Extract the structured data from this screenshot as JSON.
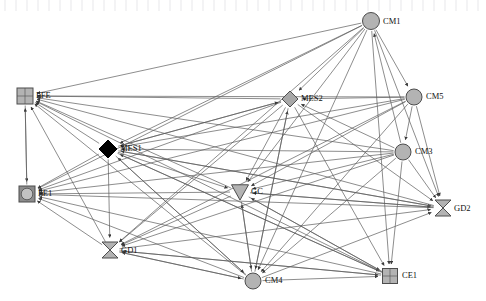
{
  "figure": {
    "kind": "directed-network-diagram",
    "width": 486,
    "height": 301,
    "background": "#ffffff",
    "edge_color": "#5b5b5b",
    "label_color": "#111111"
  },
  "chart_data": {
    "type": "diagram",
    "title": "",
    "xlabel": "",
    "ylabel": "",
    "directed": true,
    "nodes": [
      {
        "id": "CM1",
        "label": "CM1",
        "shape": "circle",
        "x": 371,
        "y": 21,
        "size": 17,
        "fill": "#b3b3b3",
        "stroke": "#4d4d4d",
        "label_dx": 12,
        "label_dy": 3
      },
      {
        "id": "FFE",
        "label": "FFE",
        "shape": "square",
        "x": 25,
        "y": 96,
        "size": 16,
        "fill": "#b3b3b3",
        "stroke": "#4d4d4d",
        "label_dx": 11,
        "label_dy": 2
      },
      {
        "id": "MES2",
        "label": "MES2",
        "shape": "diamond",
        "x": 290,
        "y": 99,
        "size": 16,
        "fill": "#a8a8a8",
        "stroke": "#4d4d4d",
        "label_dx": 11,
        "label_dy": 2
      },
      {
        "id": "CM5",
        "label": "CM5",
        "shape": "circle",
        "x": 414,
        "y": 97,
        "size": 16,
        "fill": "#b3b3b3",
        "stroke": "#4d4d4d",
        "label_dx": 12,
        "label_dy": 2
      },
      {
        "id": "MES1",
        "label": "MES1",
        "shape": "diamond",
        "x": 108,
        "y": 149,
        "size": 18,
        "fill": "#000000",
        "stroke": "#000000",
        "label_dx": 12,
        "label_dy": 2
      },
      {
        "id": "CM3",
        "label": "CM3",
        "shape": "circle",
        "x": 403,
        "y": 152,
        "size": 16,
        "fill": "#b3b3b3",
        "stroke": "#4d4d4d",
        "label_dx": 12,
        "label_dy": 2
      },
      {
        "id": "FE1",
        "label": "FE1",
        "shape": "circle-in-square",
        "x": 27,
        "y": 194,
        "size": 16,
        "fill": "#b3b3b3",
        "stroke": "#4d4d4d",
        "label_dx": 11,
        "label_dy": 2
      },
      {
        "id": "GC",
        "label": "GC",
        "shape": "triangle-down",
        "x": 240,
        "y": 192,
        "size": 17,
        "fill": "#b3b3b3",
        "stroke": "#4d4d4d",
        "label_dx": 11,
        "label_dy": 2
      },
      {
        "id": "GD2",
        "label": "GD2",
        "shape": "bowtie",
        "x": 443,
        "y": 208,
        "size": 16,
        "fill": "#b3b3b3",
        "stroke": "#4d4d4d",
        "label_dx": 11,
        "label_dy": 3
      },
      {
        "id": "GD1",
        "label": "GD1",
        "shape": "bowtie",
        "x": 110,
        "y": 250,
        "size": 16,
        "fill": "#b3b3b3",
        "stroke": "#4d4d4d",
        "label_dx": 11,
        "label_dy": 3
      },
      {
        "id": "CM4",
        "label": "CM4",
        "shape": "circle",
        "x": 253,
        "y": 281,
        "size": 16,
        "fill": "#b3b3b3",
        "stroke": "#4d4d4d",
        "label_dx": 12,
        "label_dy": 2
      },
      {
        "id": "CE1",
        "label": "CE1",
        "shape": "square",
        "x": 390,
        "y": 276,
        "size": 15,
        "fill": "#b3b3b3",
        "stroke": "#4d4d4d",
        "label_dx": 12,
        "label_dy": 2
      }
    ],
    "edges": [
      {
        "from": "CM1",
        "to": "FFE"
      },
      {
        "from": "CM1",
        "to": "MES1"
      },
      {
        "from": "CM1",
        "to": "FE1"
      },
      {
        "from": "CM1",
        "to": "MES2"
      },
      {
        "from": "CM1",
        "to": "GC"
      },
      {
        "from": "CM1",
        "to": "GD1"
      },
      {
        "from": "CM1",
        "to": "CM4"
      },
      {
        "from": "CM1",
        "to": "CE1"
      },
      {
        "from": "CM1",
        "to": "GD2"
      },
      {
        "from": "CM5",
        "to": "FFE"
      },
      {
        "from": "CM5",
        "to": "MES1"
      },
      {
        "from": "CM5",
        "to": "MES2"
      },
      {
        "from": "CM5",
        "to": "FE1"
      },
      {
        "from": "CM5",
        "to": "GC"
      },
      {
        "from": "CM5",
        "to": "GD1"
      },
      {
        "from": "CM5",
        "to": "CM4"
      },
      {
        "from": "CM5",
        "to": "GD2"
      },
      {
        "from": "CM3",
        "to": "FFE"
      },
      {
        "from": "CM3",
        "to": "MES1"
      },
      {
        "from": "CM3",
        "to": "MES2"
      },
      {
        "from": "CM3",
        "to": "FE1"
      },
      {
        "from": "CM3",
        "to": "GC"
      },
      {
        "from": "CM3",
        "to": "GD1"
      },
      {
        "from": "CM3",
        "to": "CM4"
      },
      {
        "from": "CM3",
        "to": "GD2"
      },
      {
        "from": "CM3",
        "to": "CE1"
      },
      {
        "from": "CM4",
        "to": "FFE"
      },
      {
        "from": "CM4",
        "to": "MES1"
      },
      {
        "from": "CM4",
        "to": "MES2"
      },
      {
        "from": "CM4",
        "to": "FE1"
      },
      {
        "from": "CM4",
        "to": "GC"
      },
      {
        "from": "CM4",
        "to": "GD1"
      },
      {
        "from": "CM4",
        "to": "GD2"
      },
      {
        "from": "CM4",
        "to": "CE1"
      },
      {
        "from": "MES2",
        "to": "FFE"
      },
      {
        "from": "MES2",
        "to": "MES1"
      },
      {
        "from": "MES2",
        "to": "FE1"
      },
      {
        "from": "MES2",
        "to": "GC"
      },
      {
        "from": "MES2",
        "to": "GD1"
      },
      {
        "from": "MES2",
        "to": "CM4"
      },
      {
        "from": "MES2",
        "to": "GD2"
      },
      {
        "from": "MES2",
        "to": "CE1"
      },
      {
        "from": "MES1",
        "to": "FFE"
      },
      {
        "from": "MES1",
        "to": "FE1"
      },
      {
        "from": "MES1",
        "to": "GC"
      },
      {
        "from": "MES1",
        "to": "GD1"
      },
      {
        "from": "MES1",
        "to": "CM4"
      },
      {
        "from": "MES1",
        "to": "GD2"
      },
      {
        "from": "MES1",
        "to": "CE1"
      },
      {
        "from": "MES1",
        "to": "MES2"
      },
      {
        "from": "GC",
        "to": "FFE"
      },
      {
        "from": "GC",
        "to": "FE1"
      },
      {
        "from": "GC",
        "to": "GD1"
      },
      {
        "from": "GC",
        "to": "CM4"
      },
      {
        "from": "GC",
        "to": "GD2"
      },
      {
        "from": "GC",
        "to": "CE1"
      },
      {
        "from": "GD1",
        "to": "FFE"
      },
      {
        "from": "GD1",
        "to": "FE1"
      },
      {
        "from": "GD1",
        "to": "CM4"
      },
      {
        "from": "GD1",
        "to": "GD2"
      },
      {
        "from": "GD1",
        "to": "CE1"
      },
      {
        "from": "GD2",
        "to": "FFE"
      },
      {
        "from": "GD2",
        "to": "FE1"
      },
      {
        "from": "GD2",
        "to": "MES1"
      },
      {
        "from": "GD2",
        "to": "GC"
      },
      {
        "from": "CE1",
        "to": "FFE"
      },
      {
        "from": "CE1",
        "to": "FE1"
      },
      {
        "from": "CE1",
        "to": "MES1"
      },
      {
        "from": "CE1",
        "to": "GC"
      },
      {
        "from": "CE1",
        "to": "GD1"
      },
      {
        "from": "FFE",
        "to": "FE1"
      },
      {
        "from": "FE1",
        "to": "FFE"
      },
      {
        "from": "CM1",
        "to": "CM5"
      },
      {
        "from": "CM5",
        "to": "CM3"
      },
      {
        "from": "CM3",
        "to": "CM1"
      }
    ]
  }
}
